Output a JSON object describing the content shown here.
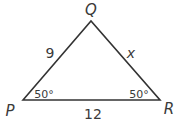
{
  "figure": {
    "type": "triangle",
    "colors": {
      "stroke": "#333333",
      "text": "#3a3a3a",
      "background": "#ffffff"
    },
    "vertices": {
      "P": {
        "label": "P",
        "x": 23,
        "y": 100
      },
      "Q": {
        "label": "Q",
        "x": 91,
        "y": 21
      },
      "R": {
        "label": "R",
        "x": 160,
        "y": 100
      }
    },
    "sides": {
      "PQ": {
        "label": "9"
      },
      "QR": {
        "label": "x"
      },
      "PR": {
        "label": "12"
      }
    },
    "angles": {
      "P": {
        "label": "50°"
      },
      "R": {
        "label": "50°"
      }
    }
  }
}
